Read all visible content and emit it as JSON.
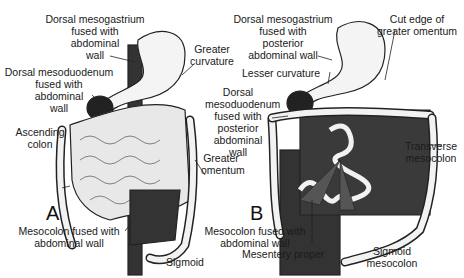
{
  "figure": {
    "panels": [
      {
        "letter": "A",
        "labels": {
          "dorsal_mesogastrium": [
            "Dorsal mesogastrium",
            "fused with",
            "abdominal",
            "wall"
          ],
          "greater_curvature": [
            "Greater",
            "curvature"
          ],
          "dorsal_mesoduodenum": [
            "Dorsal mesoduodenum",
            "fused with",
            "abdominal",
            "wall"
          ],
          "ascending_colon": [
            "Ascending",
            "colon"
          ],
          "greater_omentum": [
            "Greater",
            "omentum"
          ],
          "mesocolon_fused": [
            "Mesocolon fused with",
            "abdominal wall"
          ],
          "sigmoid": "Sigmoid"
        }
      },
      {
        "letter": "B",
        "labels": {
          "dorsal_mesogastrium": [
            "Dorsal mesogastrium",
            "fused with",
            "posterior",
            "abdominal wall"
          ],
          "cut_edge": [
            "Cut edge of",
            "greater omentum"
          ],
          "lesser_curvature": "Lesser curvature",
          "dorsal_mesoduodenum": [
            "Dorsal",
            "mesoduodenum",
            "fused with",
            "posterior",
            "abdominal",
            "wall"
          ],
          "transverse_mesocolon": [
            "Transverse",
            "mesocolon"
          ],
          "mesocolon_fused": [
            "Mesocolon fused with",
            "abdominal wall"
          ],
          "mesentery_proper": "Mesentery proper",
          "sigmoid_mesocolon": [
            "Sigmoid",
            "mesocolon"
          ]
        }
      }
    ]
  }
}
